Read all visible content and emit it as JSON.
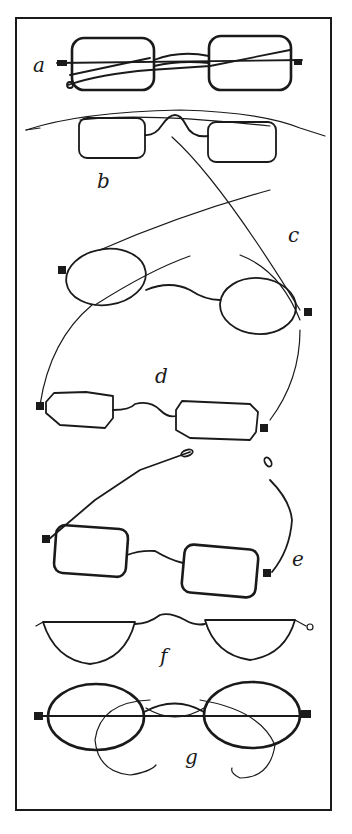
{
  "figure": {
    "items": [
      {
        "label": "a",
        "style": "rectangular lenses, folding sliding temples"
      },
      {
        "label": "b",
        "style": "rectangular lenses, high arched bridge, long temples"
      },
      {
        "label": "c",
        "style": "oval lenses, long straight temples with loop ends"
      },
      {
        "label": "d",
        "style": "octagonal lenses, curved temples"
      },
      {
        "label": "e",
        "style": "rectangular lenses, jointed sliding temples"
      },
      {
        "label": "f",
        "style": "half-moon reading lenses"
      },
      {
        "label": "g",
        "style": "oval lenses, curl-side temples"
      }
    ]
  },
  "colors": {
    "ink": "#1a1a1a",
    "paper": "#ffffff"
  }
}
